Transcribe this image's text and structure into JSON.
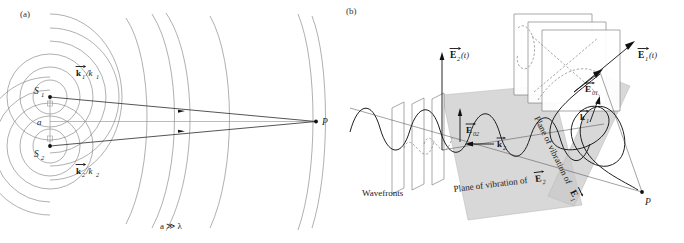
{
  "figure": {
    "background": "#ffffff",
    "ink": "#1a1a1a",
    "shade": "#c9c9c9"
  },
  "panel_a": {
    "label": "(a)",
    "source_1_label": "S",
    "source_1_sub": "1",
    "source_2_label": "S",
    "source_2_sub": "2",
    "separation_label": "a",
    "k1_label": "k",
    "k1_sub": "1",
    "k1_over": "/k",
    "k1_over_sub": "1",
    "k2_label": "k",
    "k2_sub": "2",
    "k2_over": "/k",
    "k2_over_sub": "2",
    "point_label": "P",
    "condition": "a ≫ λ",
    "condition_plain": "a >> lambda",
    "wavefront_count": 9,
    "notes": "Circular wavefronts from S1 and S2 overlap; two rays converge at distant point P."
  },
  "panel_b": {
    "label": "(b)",
    "wavefronts_label": "Wavefronts",
    "field_2_label": "E",
    "field_2_sub": "2",
    "field_2_arg": "(t)",
    "field_1_label": "E",
    "field_1_sub": "1",
    "field_1_arg": "(t)",
    "amp_02_label": "E",
    "amp_02_sub": "02",
    "amp_01_label": "E",
    "amp_01_sub": "01",
    "kvec_2_label": "k",
    "kvec_2_sub": "2",
    "kvec_1_label": "k",
    "kvec_1_sub": "1",
    "plane_2_text": "Plane of vibration of",
    "plane_2_symbol": "E",
    "plane_2_symbol_sub": "2",
    "plane_1_text": "Plane of vibration of",
    "plane_1_symbol": "E",
    "plane_1_symbol_sub": "1",
    "point_label": "P",
    "notes": "Two linearly polarized plane waves travelling toward P; shaded rectangles are the planes of vibration."
  }
}
